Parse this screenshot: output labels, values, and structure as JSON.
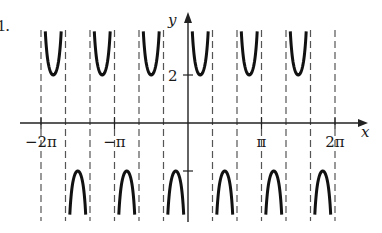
{
  "problem_number": "1.",
  "chart_data": {
    "type": "line",
    "function": "y = 2 csc(3x)",
    "amplitude": 2,
    "frequency": 3,
    "title": "",
    "xlabel": "x",
    "ylabel": "y",
    "x_ticks": [
      {
        "value": -6.2832,
        "label": "−2π"
      },
      {
        "value": -3.1416,
        "label": "−π"
      },
      {
        "value": 3.1416,
        "label": "π"
      },
      {
        "value": 6.2832,
        "label": "2π"
      }
    ],
    "y_ticks": [
      {
        "value": 2,
        "label": "2"
      },
      {
        "value": -2,
        "label": ""
      }
    ],
    "asymptotes": "x = kπ/3, k = -6 … 6",
    "xlim": [
      -6.2832,
      6.2832
    ],
    "ylim": [
      -4,
      4
    ],
    "grid": false,
    "branches": [
      {
        "interval": [
          "-2π",
          "-5π/3"
        ],
        "direction": "up",
        "extremum": 2
      },
      {
        "interval": [
          "-5π/3",
          "-4π/3"
        ],
        "direction": "down",
        "extremum": -2
      },
      {
        "interval": [
          "-4π/3",
          "-π"
        ],
        "direction": "up",
        "extremum": 2
      },
      {
        "interval": [
          "-π",
          "-2π/3"
        ],
        "direction": "down",
        "extremum": -2
      },
      {
        "interval": [
          "-2π/3",
          "-π/3"
        ],
        "direction": "up",
        "extremum": 2
      },
      {
        "interval": [
          "-π/3",
          "0"
        ],
        "direction": "down",
        "extremum": -2
      },
      {
        "interval": [
          "0",
          "π/3"
        ],
        "direction": "up",
        "extremum": 2
      },
      {
        "interval": [
          "π/3",
          "2π/3"
        ],
        "direction": "down",
        "extremum": -2
      },
      {
        "interval": [
          "2π/3",
          "π"
        ],
        "direction": "up",
        "extremum": 2
      },
      {
        "interval": [
          "π",
          "4π/3"
        ],
        "direction": "down",
        "extremum": -2
      },
      {
        "interval": [
          "4π/3",
          "5π/3"
        ],
        "direction": "up",
        "extremum": 2
      },
      {
        "interval": [
          "5π/3",
          "2π"
        ],
        "direction": "down",
        "extremum": -2
      }
    ],
    "colors": {
      "curve": "#111111",
      "axis": "#222222",
      "asymptote": "#555555"
    }
  }
}
